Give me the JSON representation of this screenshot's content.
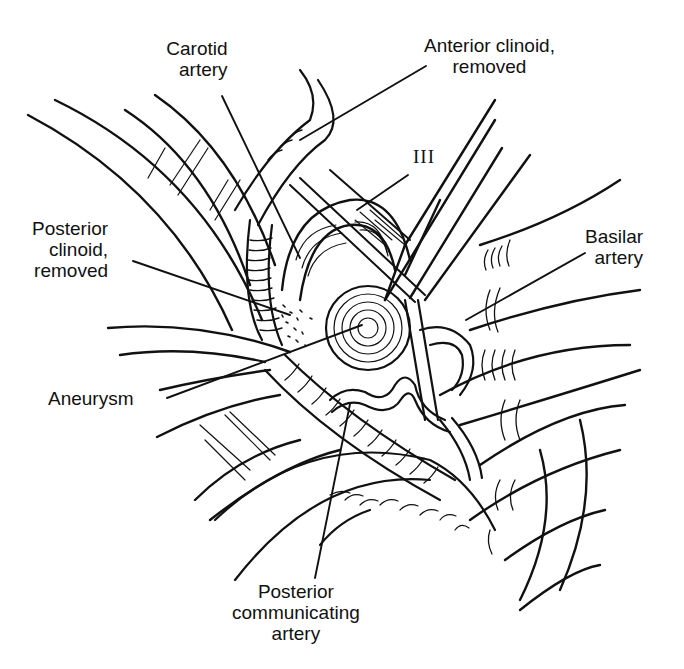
{
  "figure": {
    "type": "anatomical-illustration",
    "style": "black ink line drawing on white",
    "colors": {
      "ink": "#111111",
      "background": "#ffffff"
    }
  },
  "labels": {
    "carotid_artery": {
      "line1": "Carotid",
      "line2": "artery"
    },
    "anterior_clinoid": {
      "line1": "Anterior clinoid,",
      "line2": "removed"
    },
    "cranial_nerve": {
      "text": "III"
    },
    "posterior_clinoid": {
      "line1": "Posterior",
      "line2": "clinoid,",
      "line3": "removed"
    },
    "basilar_artery": {
      "line1": "Basilar",
      "line2": "artery"
    },
    "aneurysm": {
      "text": "Aneurysm"
    },
    "posterior_communicating_artery": {
      "line1": "Posterior",
      "line2": "communicating",
      "line3": "artery"
    }
  }
}
